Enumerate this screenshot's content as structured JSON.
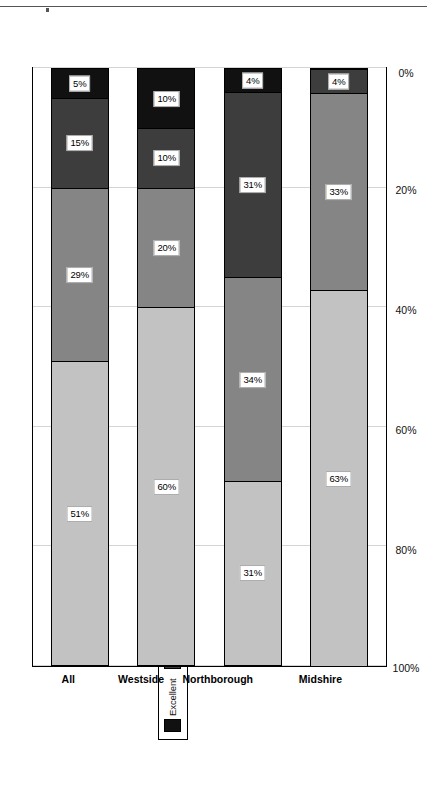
{
  "chart_data": {
    "type": "bar",
    "subtype": "stacked-100-horizontal",
    "title": "",
    "xlabel": "",
    "ylabel": "",
    "orientation": "rotated-90",
    "grid": true,
    "legend_position": "top-center",
    "axis": {
      "ticks": [
        "100%",
        "80%",
        "60%",
        "40%",
        "20%",
        "0%"
      ],
      "tick_values": [
        100,
        80,
        60,
        40,
        20,
        0
      ],
      "ylim": [
        0,
        100
      ]
    },
    "categories": [
      "All",
      "Westside",
      "Northborough",
      "Midshire"
    ],
    "series": [
      {
        "name": "Excellent",
        "color": "#111111",
        "values": [
          5,
          10,
          4,
          0
        ],
        "labels": [
          "5%",
          "10%",
          "4%",
          "0%"
        ]
      },
      {
        "name": "Positive",
        "color": "#3d3d3d",
        "values": [
          15,
          10,
          31,
          4
        ],
        "labels": [
          "15%",
          "10%",
          "31%",
          "4%"
        ]
      },
      {
        "name": "Adequate",
        "color": "#858585",
        "values": [
          29,
          20,
          34,
          33
        ],
        "labels": [
          "29%",
          "20%",
          "34%",
          "33%"
        ]
      },
      {
        "name": "Limited",
        "color": "#c2c2c2",
        "swatch_color": "#ffffff",
        "values": [
          51,
          60,
          31,
          63
        ],
        "labels": [
          "51%",
          "60%",
          "31%",
          "63%"
        ]
      }
    ]
  },
  "legend": {
    "items": [
      {
        "label": "Excellent",
        "color": "#111111"
      },
      {
        "label": "Positive",
        "color": "#3d3d3d"
      },
      {
        "label": "Adequate",
        "color": "#858585"
      },
      {
        "label": "Limited",
        "color": "#ffffff"
      }
    ]
  }
}
